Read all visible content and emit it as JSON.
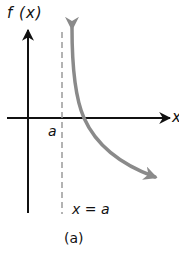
{
  "figure": {
    "y_axis_label": "f (x)",
    "x_axis_label": "x",
    "asymptote_point_label": "a",
    "asymptote_equation": "x = a",
    "caption": "(a)"
  },
  "colors": {
    "axes": "#111111",
    "curve": "#8a8a8a",
    "asymptote": "#9a9a9a"
  },
  "elements": {
    "curve_description": "Decreasing curve with vertical asymptote at x = a, approaching +infinity as x→a+ and decreasing to the lower right",
    "asymptote_style": "dashed vertical line"
  }
}
